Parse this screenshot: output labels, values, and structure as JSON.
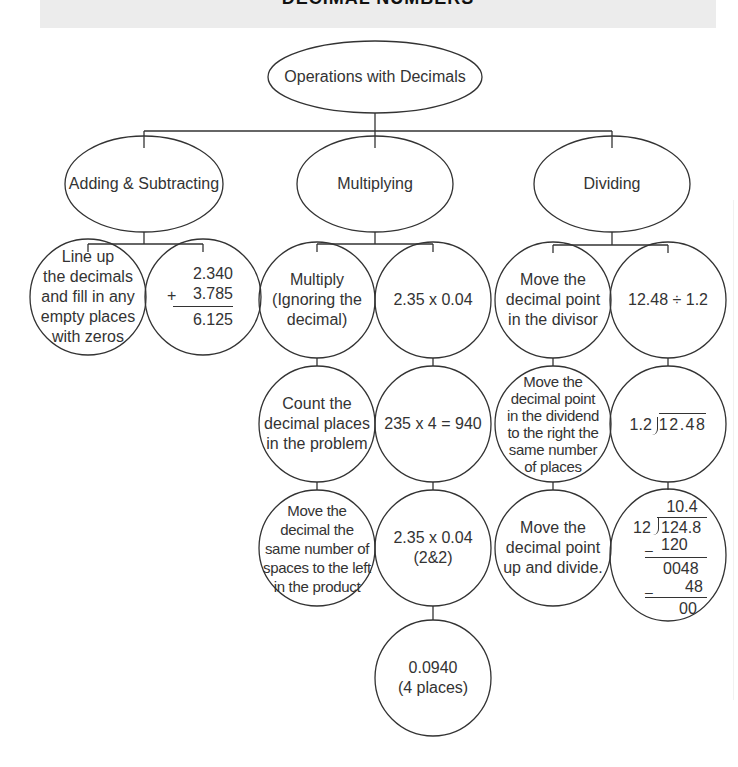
{
  "header": {
    "title": "DECIMAL NUMBERS"
  },
  "root": {
    "label": "Operations with Decimals"
  },
  "branches": [
    {
      "label": "Adding & Subtracting",
      "left": [
        "Line up",
        "the decimals",
        "and fill in any",
        "empty places",
        "with zeros"
      ],
      "right": {
        "addend1": "2.340",
        "operator": "+",
        "addend2": "3.785",
        "sum": "6.125"
      }
    },
    {
      "label": "Multiplying",
      "left": [
        [
          "Multiply",
          "(Ignoring the",
          "decimal)"
        ],
        [
          "Count the",
          "decimal places",
          "in the problem"
        ],
        [
          "Move the",
          "decimal the",
          "same number of",
          "spaces to the left",
          "in the product"
        ]
      ],
      "right": [
        [
          "2.35 x 0.04"
        ],
        [
          "235 x 4 = 940"
        ],
        [
          "2.35 x 0.04",
          "(2&2)"
        ],
        [
          "0.0940",
          "(4 places)"
        ]
      ]
    },
    {
      "label": "Dividing",
      "left": [
        [
          "Move the",
          "decimal point",
          "in the divisor"
        ],
        [
          "Move the",
          "decimal point",
          "in the dividend",
          "to the right the",
          "same number",
          "of places"
        ],
        [
          "Move the",
          "decimal point",
          "up and divide."
        ]
      ],
      "right": {
        "problem": "12.48 ÷ 1.2",
        "setup": {
          "divisor": "1.2",
          "dividend": "12.48"
        },
        "long_division": {
          "quotient": "10.4",
          "divisor": "12",
          "dividend": "124.8",
          "step1_minus": "–",
          "step1": "120",
          "remainder1": "0048",
          "step2_minus": "–",
          "step2": "48",
          "remainder2": "00"
        }
      }
    }
  ],
  "colors": {
    "line": "#333333",
    "band": "#ececec",
    "text": "#333333"
  }
}
